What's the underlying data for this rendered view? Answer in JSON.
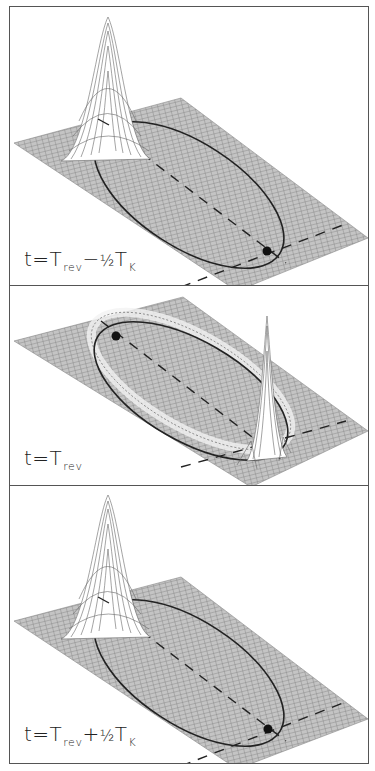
{
  "figure": {
    "colors": {
      "frame": "#555555",
      "grid": "#8a8a8a",
      "plane_fill": "#bdbdbd",
      "orbit": "#222222",
      "dot": "#111111",
      "peak_fill": "#ffffff"
    },
    "panels": [
      {
        "id": "top",
        "label": {
          "t": "t",
          "eq": "=",
          "T": "T",
          "rev": "rev",
          "op": "−",
          "frac": "½",
          "T2": "T",
          "K": "K"
        },
        "label_text": "t = T_rev − ½ T_K",
        "packet": "localized-peak-far-end",
        "dot_position": "near-end-of-orbit"
      },
      {
        "id": "middle",
        "label": {
          "t": "t",
          "eq": "=",
          "T": "T",
          "rev": "rev"
        },
        "label_text": "t = T_rev",
        "packet": "sharp-spike-near-end-with-spread-ring",
        "dot_position": "far-end-of-orbit"
      },
      {
        "id": "bottom",
        "label": {
          "t": "t",
          "eq": "=",
          "T": "T",
          "rev": "rev",
          "op": "+",
          "frac": "½",
          "T2": "T",
          "K": "K"
        },
        "label_text": "t = T_rev + ½ T_K",
        "packet": "localized-peak-far-end",
        "dot_position": "near-end-of-orbit"
      }
    ]
  }
}
